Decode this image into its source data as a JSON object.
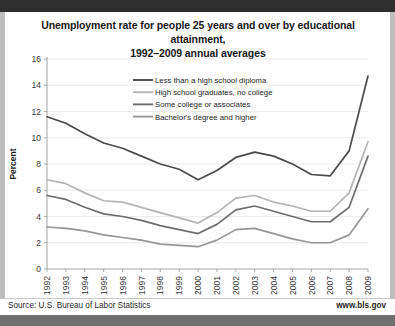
{
  "card": {
    "title_line1": "Unemployment rate for people 25 years and over by educational attainment,",
    "title_line2": "1992–2009 annual averages"
  },
  "footer": {
    "source": "Source: U.S. Bureau of Labor Statistics",
    "website": "www.bls.gov"
  },
  "colors": {
    "less_than_hs": "#4a4a4a",
    "hs_grad": "#b4b4b4",
    "some_college": "#6e6e6e",
    "bachelors": "#969696",
    "grid": "#e2e2e2",
    "axis": "#9a9a9a",
    "band_top": "#2e2e2e",
    "band_bottom": "#6f6f6f",
    "text": "#1f1f1f"
  },
  "chart_data": {
    "type": "line",
    "title": "Unemployment rate for people 25 years and over by educational attainment, 1992–2009 annual averages",
    "xlabel": "",
    "ylabel": "Percent",
    "ylim": [
      0,
      16
    ],
    "yticks": [
      0,
      2,
      4,
      6,
      8,
      10,
      12,
      14,
      16
    ],
    "grid": true,
    "legend_position": "upper-center",
    "categories": [
      "1992",
      "1993",
      "1994",
      "1995",
      "1996",
      "1997",
      "1998",
      "1999",
      "2000",
      "2001",
      "2002",
      "2003",
      "2004",
      "2005",
      "2006",
      "2007",
      "2008",
      "2009"
    ],
    "series": [
      {
        "name": "Less than a high school diploma",
        "color": "#4a4a4a",
        "values": [
          11.6,
          11.1,
          10.3,
          9.6,
          9.2,
          8.6,
          8.0,
          7.6,
          6.8,
          7.5,
          8.5,
          8.9,
          8.6,
          8.0,
          7.2,
          7.1,
          9.0,
          14.7
        ]
      },
      {
        "name": "High school graduates, no college",
        "color": "#b4b4b4",
        "values": [
          6.8,
          6.5,
          5.8,
          5.2,
          5.1,
          4.7,
          4.3,
          3.9,
          3.5,
          4.3,
          5.4,
          5.6,
          5.1,
          4.8,
          4.4,
          4.4,
          5.8,
          9.7
        ]
      },
      {
        "name": "Some college or associates",
        "color": "#6e6e6e",
        "values": [
          5.6,
          5.3,
          4.7,
          4.2,
          4.0,
          3.7,
          3.3,
          3.0,
          2.7,
          3.4,
          4.5,
          4.8,
          4.4,
          4.0,
          3.6,
          3.6,
          4.7,
          8.6
        ]
      },
      {
        "name": "Bachelor's degree and higher",
        "color": "#969696",
        "values": [
          3.2,
          3.1,
          2.9,
          2.6,
          2.4,
          2.2,
          1.9,
          1.8,
          1.7,
          2.2,
          3.0,
          3.1,
          2.7,
          2.3,
          2.0,
          2.0,
          2.6,
          4.6
        ]
      }
    ]
  }
}
